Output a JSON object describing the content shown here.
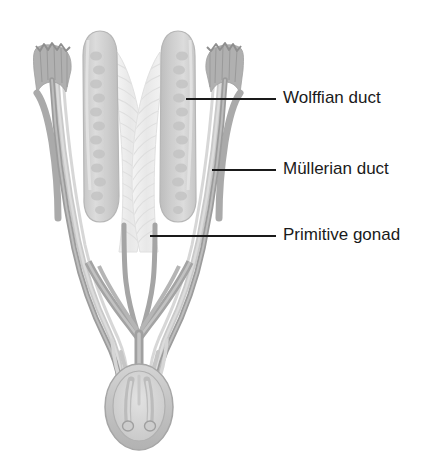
{
  "figure": {
    "name": "indifferent-urogenital-system",
    "background_color": "#ffffff",
    "width": 437,
    "height": 465
  },
  "palette": {
    "duct_dark": "#9a9a9a",
    "duct_mid": "#b4b4b4",
    "duct_light": "#cfcfcf",
    "gonad_fill": "#d2d2d2",
    "gonad_stroke": "#b9b9b9",
    "gonad_cord": "#c2c2c2",
    "mesonephros_fill": "#ededed",
    "mesonephros_stroke": "#dcdcdc",
    "sinus_fill": "#c9c9c9",
    "sinus_stroke": "#a8a8a8",
    "leader_line": "#1a1a1a",
    "label_text": "#1a1a1a"
  },
  "labels": [
    {
      "id": "wolffian-duct",
      "text": "Wolffian duct",
      "text_x": 283,
      "text_y": 99,
      "leader": {
        "x1": 186,
        "y1": 99,
        "x2": 276,
        "y2": 99
      }
    },
    {
      "id": "mullerian-duct",
      "text": "Müllerian duct",
      "text_x": 283,
      "text_y": 170,
      "leader": {
        "x1": 212,
        "y1": 170,
        "x2": 276,
        "y2": 170
      }
    },
    {
      "id": "primitive-gonad",
      "text": "Primitive gonad",
      "text_x": 283,
      "text_y": 236,
      "leader": {
        "x1": 150,
        "y1": 236,
        "x2": 276,
        "y2": 236
      }
    }
  ],
  "structures": {
    "fimbria_left": "left-fimbriated-funnel",
    "fimbria_right": "right-fimbriated-funnel",
    "gonad_left": "left-primitive-gonad",
    "gonad_right": "right-primitive-gonad",
    "mesonephros_left": "left-mesonephros",
    "mesonephros_right": "right-mesonephros",
    "urogenital_sinus": "urogenital-sinus"
  }
}
